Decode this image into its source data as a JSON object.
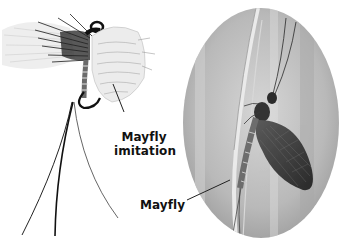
{
  "figure": {
    "labels": {
      "imitation": [
        "Mayfly",
        "imitation"
      ],
      "real": "Mayfly"
    },
    "panels": [
      {
        "id": "fly-imitation",
        "description": "Fly-fishing mayfly imitation tied on a hook with feather wings and long tail fibers"
      },
      {
        "id": "real-mayfly",
        "description": "Photograph of a real mayfly resting on a grass stem, shown in an oval frame"
      }
    ],
    "colors": {
      "background": "#ffffff",
      "label_text": "#111111",
      "oval_background": "#bdbdbd",
      "leader_line": "#222222"
    }
  }
}
